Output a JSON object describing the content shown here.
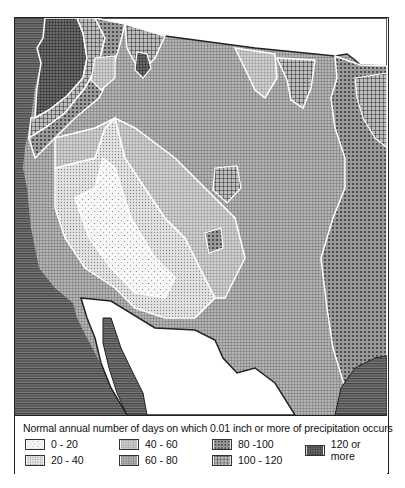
{
  "map": {
    "title": "Normal annual number of days on which 0.01 inch or more of precipitation occurs",
    "region": "Western United States",
    "classes": [
      {
        "label": "0 - 20",
        "pattern": "sparse-dots",
        "fill": "#f4f4f4"
      },
      {
        "label": "20 - 40",
        "pattern": "dense-dots",
        "fill": "#dcdcdc"
      },
      {
        "label": "40 - 60",
        "pattern": "fine-grid",
        "fill": "#c4c4c4"
      },
      {
        "label": "60 - 80",
        "pattern": "grid",
        "fill": "#a8a8a8"
      },
      {
        "label": "80 -100",
        "pattern": "coarse-dots",
        "fill": "#8c8c8c"
      },
      {
        "label": "100 - 120",
        "pattern": "coarse-grid",
        "fill": "#6a6a6a"
      },
      {
        "label": "120 or more",
        "pattern": "dark-hatch",
        "fill": "#4a4a4a"
      }
    ],
    "ocean_fill": "#555555"
  },
  "legend": {
    "title": "Normal annual number of days on which 0.01 inch or more of precipitation occurs",
    "items": [
      {
        "label": "0 - 20"
      },
      {
        "label": "20 - 40"
      },
      {
        "label": "40 - 60"
      },
      {
        "label": "60 - 80"
      },
      {
        "label": "80 -100"
      },
      {
        "label": "100 - 120"
      },
      {
        "label": "120 or more"
      }
    ]
  }
}
